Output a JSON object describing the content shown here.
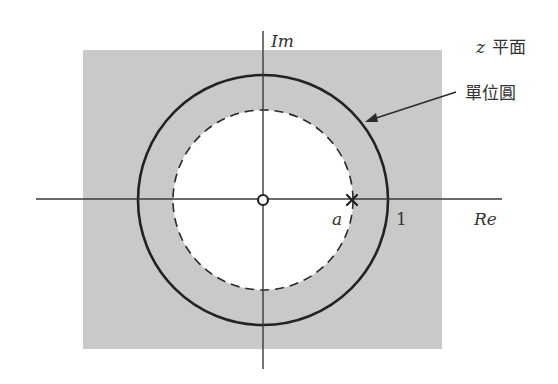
{
  "diagram": {
    "plane_label": {
      "variable": "z",
      "text": "平面"
    },
    "unit_circle_label": "單位圓",
    "axes": {
      "real_label": "Re",
      "imag_label": "Im"
    },
    "points": {
      "zero_marker": "o",
      "pole_label": "a",
      "unit_label": "1"
    },
    "colors": {
      "roc_fill": "#c9c9c9",
      "stroke": "#2a2a2a",
      "axis": "#3a3a3a",
      "background": "#ffffff"
    },
    "geometry": {
      "origin": [
        263,
        200
      ],
      "unit_circle_radius": 125,
      "pole_radius": 90,
      "roc_rect": [
        83,
        50,
        359,
        299
      ]
    }
  }
}
